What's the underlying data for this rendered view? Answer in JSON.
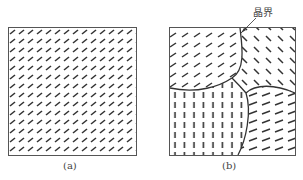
{
  "figures": [
    {
      "id": "a",
      "caption": "(a)",
      "description": "single crystal with uniform orientation"
    },
    {
      "id": "b",
      "caption": "(b)",
      "description": "polycrystal with multiple grains",
      "annotation": "晶界"
    }
  ],
  "colors": {
    "stroke": "#333333",
    "frame": "#555555",
    "background": "#ffffff"
  }
}
